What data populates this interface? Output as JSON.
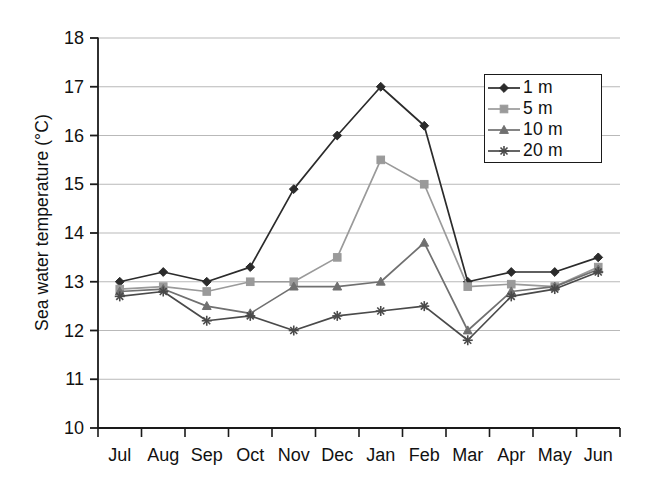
{
  "chart_data": {
    "type": "line",
    "title": "",
    "xlabel": "",
    "ylabel": "Sea water temperature (°C)",
    "categories": [
      "Jul",
      "Aug",
      "Sep",
      "Oct",
      "Nov",
      "Dec",
      "Jan",
      "Feb",
      "Mar",
      "Apr",
      "May",
      "Jun"
    ],
    "ylim": [
      10,
      18
    ],
    "yticks": [
      "10",
      "11",
      "12",
      "13",
      "14",
      "15",
      "16",
      "17",
      "18"
    ],
    "grid": "horizontal",
    "legend_position": "top-right",
    "series": [
      {
        "name": "1 m",
        "marker": "diamond",
        "color": "#2b2b2b",
        "values": [
          13.0,
          13.2,
          13.0,
          13.3,
          14.9,
          16.0,
          17.0,
          16.2,
          13.0,
          13.2,
          13.2,
          13.5
        ]
      },
      {
        "name": "5 m",
        "marker": "square",
        "color": "#9a9a9a",
        "values": [
          12.85,
          12.9,
          12.8,
          13.0,
          13.0,
          13.5,
          15.5,
          15.0,
          12.9,
          12.95,
          12.9,
          13.3
        ]
      },
      {
        "name": "10 m",
        "marker": "triangle",
        "color": "#707070",
        "values": [
          12.8,
          12.85,
          12.5,
          12.35,
          12.9,
          12.9,
          13.0,
          13.8,
          12.0,
          12.8,
          12.9,
          13.25
        ]
      },
      {
        "name": "20 m",
        "marker": "star",
        "color": "#4a4a4a",
        "values": [
          12.7,
          12.8,
          12.2,
          12.3,
          12.0,
          12.3,
          12.4,
          12.5,
          11.8,
          12.7,
          12.85,
          13.2
        ]
      }
    ]
  },
  "legend": {
    "items": [
      {
        "label": "1 m"
      },
      {
        "label": "5 m"
      },
      {
        "label": "10 m"
      },
      {
        "label": "20 m"
      }
    ]
  }
}
